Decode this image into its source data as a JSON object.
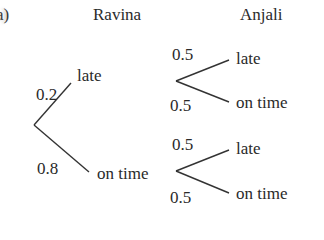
{
  "part_label": "a)",
  "headers": {
    "first": "Ravina",
    "second": "Anjali"
  },
  "tree": {
    "level1": [
      {
        "outcome": "late",
        "probability": "0.2"
      },
      {
        "outcome": "on time",
        "probability": "0.8"
      }
    ],
    "level2_after_late": [
      {
        "outcome": "late",
        "probability": "0.5"
      },
      {
        "outcome": "on time",
        "probability": "0.5"
      }
    ],
    "level2_after_on_time": [
      {
        "outcome": "late",
        "probability": "0.5"
      },
      {
        "outcome": "on time",
        "probability": "0.5"
      }
    ]
  }
}
